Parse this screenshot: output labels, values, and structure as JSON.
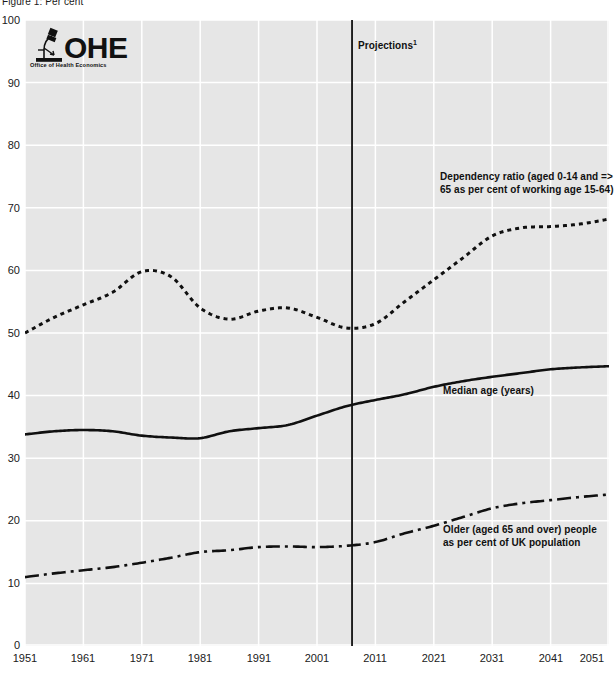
{
  "figure": {
    "caption": "Figure 1: Per cent",
    "logo": {
      "name": "OHE",
      "subtitle": "Office of Health Economics",
      "icon": "microscope-icon"
    }
  },
  "annotations": {
    "projections": "Projections",
    "projections_footnote": "1",
    "dependency": "Dependency ratio (aged 0-14 and => 65 as per cent of working age 15-64)",
    "median": "Median age (years)",
    "older": "Older (aged 65 and over) people as per cent of UK population"
  },
  "colors": {
    "plot_background": "#e6e6e6",
    "gridline": "#ffffff",
    "series_line": "#101010",
    "divider": "#101010",
    "tick_label": "#202020"
  },
  "chart_data": {
    "type": "line",
    "title": "Figure 1: Per cent",
    "xlabel": "",
    "ylabel": "Per cent",
    "xlim": [
      1951,
      2051
    ],
    "ylim": [
      0,
      100
    ],
    "grid": true,
    "legend_position": "inline-annotations",
    "xticks": [
      1951,
      1961,
      1971,
      1981,
      1991,
      2001,
      2011,
      2021,
      2031,
      2041,
      2051
    ],
    "yticks": [
      0,
      10,
      20,
      30,
      40,
      50,
      60,
      70,
      80,
      90,
      100
    ],
    "projection_divider_x": 2007,
    "x": [
      1951,
      1956,
      1961,
      1966,
      1971,
      1976,
      1981,
      1986,
      1991,
      1996,
      2001,
      2006,
      2011,
      2016,
      2021,
      2026,
      2031,
      2036,
      2041,
      2046,
      2051
    ],
    "series": [
      {
        "name": "Dependency ratio (aged 0-14 and => 65 as per cent of working age 15-64)",
        "style": "dotted",
        "values": [
          50.0,
          52.5,
          54.5,
          56.5,
          59.8,
          59.0,
          54.0,
          52.2,
          53.5,
          54.0,
          52.5,
          50.8,
          51.5,
          55.0,
          58.5,
          62.0,
          65.5,
          66.8,
          67.0,
          67.4,
          68.2
        ]
      },
      {
        "name": "Median age (years)",
        "style": "solid",
        "values": [
          33.8,
          34.3,
          34.5,
          34.3,
          33.6,
          33.3,
          33.2,
          34.3,
          34.8,
          35.3,
          36.8,
          38.3,
          39.3,
          40.2,
          41.4,
          42.3,
          43.0,
          43.6,
          44.2,
          44.5,
          44.7
        ]
      },
      {
        "name": "Older (aged 65 and over) people as per cent of UK population",
        "style": "dashdot",
        "values": [
          11.0,
          11.6,
          12.1,
          12.6,
          13.3,
          14.1,
          15.0,
          15.3,
          15.8,
          15.9,
          15.8,
          16.0,
          16.6,
          18.0,
          19.2,
          20.6,
          22.0,
          22.8,
          23.3,
          23.8,
          24.2
        ]
      }
    ]
  }
}
